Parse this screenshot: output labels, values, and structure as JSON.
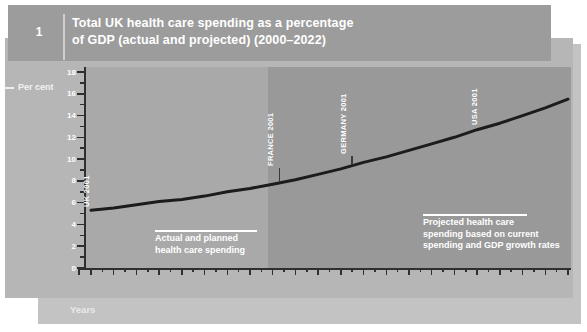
{
  "figure": {
    "number": "1",
    "title_line1": "Total UK health care spending as a percentage",
    "title_line2": "of GDP (actual and projected) (2000–2022)"
  },
  "chart_data": {
    "type": "line",
    "title": "Total UK health care spending as a percentage of GDP (actual and projected) (2000–2022)",
    "ylabel": "Per cent",
    "xlabel": "Years",
    "ylim": [
      0,
      18
    ],
    "y_tick_step": 2,
    "y_minor_tick_step": 1,
    "grid": false,
    "legend": "none",
    "categories": [
      "00-01",
      "01-02",
      "02-03",
      "03-04",
      "04-05",
      "05-06",
      "06-07",
      "07-08",
      "08-09",
      "09-10",
      "10-11",
      "11-12",
      "12-13",
      "13-14",
      "14-15",
      "15-16",
      "16-17",
      "17-18",
      "18-19",
      "19-20",
      "20-21",
      "21-22"
    ],
    "series": [
      {
        "name": "Total UK health care spending (% of GDP)",
        "values": [
          5.3,
          5.5,
          5.8,
          6.1,
          6.3,
          6.6,
          7.0,
          7.3,
          7.7,
          8.1,
          8.6,
          9.1,
          9.7,
          10.2,
          10.8,
          11.4,
          12.0,
          12.7,
          13.3,
          14.0,
          14.7,
          15.5
        ]
      }
    ],
    "projection_boundary_category": "08-09",
    "regions": [
      {
        "name": "actual",
        "lines": [
          "Actual and planned",
          "health care spending"
        ]
      },
      {
        "name": "projected",
        "lines": [
          "Projected health care",
          "spending based on current",
          "spending and GDP growth rates"
        ]
      }
    ],
    "reference_labels": [
      {
        "text": "UK 2001",
        "x_index": 0.2,
        "tick_len": 0
      },
      {
        "text": "FRANCE 2001",
        "x_index": 8.3,
        "tick_len": 14
      },
      {
        "text": "GERMANY 2001",
        "x_index": 11.5,
        "tick_len": 9
      },
      {
        "text": "USA 2001",
        "x_index": 17.3,
        "tick_len": 0
      }
    ],
    "colors": {
      "line": "#1c1c1c",
      "axis": "#2f2f2f",
      "actual_region_bg": "#a9a9a9",
      "projected_region_bg": "#999999",
      "panel_bg": "#b6b6b6",
      "back_panel_bg": "#c3c3c3",
      "header_bg": "#9c9c9c",
      "text": "#ffffff"
    }
  }
}
